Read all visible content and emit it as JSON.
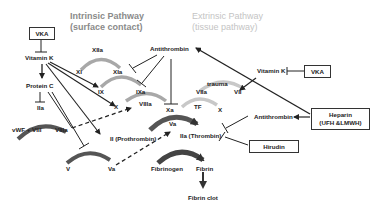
{
  "diagram": {
    "title_intrinsic": [
      "Intrinsic Pathway",
      "(surface contact)"
    ],
    "title_extrinsic": [
      "Extrinsic Pathway",
      "(tissue pathway)"
    ],
    "boxes": {
      "vka_left": "VKA",
      "vka_right": "VKA",
      "heparin_line1": "Heparin",
      "heparin_line2": "(UFH &LMWH)",
      "hirudin": "Hirudin"
    },
    "nodes": {
      "vitamin_k_left": "Vitamin K",
      "vitamin_k_right": "Vitamin K",
      "protein_c": "Protein C",
      "iia_small": "IIa",
      "vwf_viii": "vWF + VIII",
      "viiia_left": "VIIIa",
      "xiia": "XIIa",
      "xi": "XI",
      "xia": "XIa",
      "ix": "IX",
      "ixa": "IXa",
      "x_left": "X",
      "viiia_mid": "VIIIa",
      "antithrombin_top": "Antithrombin",
      "trauma": "trauma",
      "viia": "VIIa",
      "vii": "VII",
      "xa": "Xa",
      "tf": "TF",
      "x_right": "X",
      "va_mid": "Va",
      "ii_prothrombin": "II (Prothrombin)",
      "iia_thrombin": "IIa (Thrombin)",
      "antithrombin_right": "Antithrombin",
      "v": "V",
      "va_bottom": "Va",
      "fibrinogen": "Fibrinogen",
      "fibrin": "Fibrin",
      "fibrin_clot": "Fibrin clot"
    },
    "colors": {
      "arc_dark": "#555555",
      "arc_light": "#a8a8a8",
      "arc_lighter": "#c8c8c8",
      "line": "#222222",
      "header_intrinsic": "#8a8a8a",
      "header_extrinsic": "#c4c4c4"
    }
  }
}
